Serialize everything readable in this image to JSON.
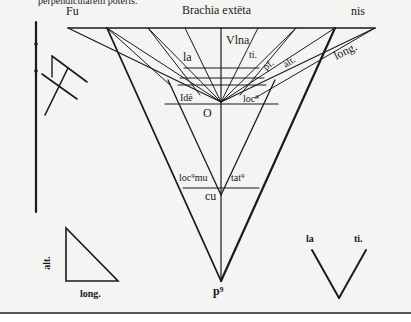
{
  "caption_top": "perpendicularem poteris.",
  "labels": {
    "fu": "Fu",
    "brachia": "Brachia extēta",
    "nis": "nis",
    "vlna": "Vlna",
    "la": "la",
    "ti": "ti.",
    "pf": "pf.",
    "alt": "alt.",
    "long": "long.",
    "idem": "Idē",
    "locus": "loc⁹",
    "o": "O",
    "locomu": "loc⁹mu",
    "tatus": "tat⁹",
    "cu": "cu",
    "pus": "p⁹",
    "tri_alt": "alt.",
    "tri_long": "long.",
    "v_la": "la",
    "v_ti": "ti."
  },
  "colors": {
    "ink": "#1a1a1a",
    "paper": "#f4f4f2",
    "rule": "#555555"
  }
}
